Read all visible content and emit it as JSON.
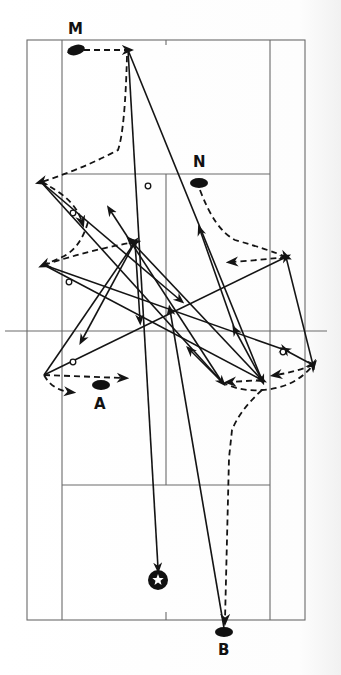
{
  "diagram": {
    "colors": {
      "ink": "#141414",
      "court": "#6a6a6a",
      "background": "#ffffff"
    },
    "court": {
      "outer": {
        "x1": 27,
        "y1": 40,
        "x2": 305,
        "y2": 620
      },
      "singles_sidelines_x": [
        62,
        270
      ],
      "net_y": 331,
      "net_x_range": [
        5,
        327
      ],
      "short_service_lines_y": [
        174,
        485
      ],
      "center_line_x": 166,
      "center_ticks": [
        {
          "y1": 40,
          "y2": 45
        },
        {
          "y1": 612,
          "y2": 620
        }
      ]
    },
    "players": [
      {
        "id": "M",
        "label": "M",
        "x": 76,
        "y": 50,
        "label_x": 68,
        "label_y": 34
      },
      {
        "id": "N",
        "label": "N",
        "x": 199,
        "y": 183,
        "label_x": 193,
        "label_y": 167
      },
      {
        "id": "A",
        "label": "A",
        "x": 101,
        "y": 385,
        "label_x": 94,
        "label_y": 409
      },
      {
        "id": "B",
        "label": "B",
        "x": 224,
        "y": 632,
        "label_x": 218,
        "label_y": 655
      }
    ],
    "shuttle_end": {
      "symbol": "star",
      "x": 158,
      "y": 580
    },
    "shots": [
      {
        "from": [
          128,
          50
        ],
        "to": [
          158,
          568
        ]
      },
      {
        "from": [
          128,
          50
        ],
        "to": [
          262,
          380
        ]
      },
      {
        "from": [
          41,
          182
        ],
        "to": [
          222,
          382
        ]
      },
      {
        "from": [
          41,
          182
        ],
        "to": [
          180,
          300
        ]
      },
      {
        "from": [
          44,
          265
        ],
        "to": [
          262,
          380
        ]
      },
      {
        "from": [
          44,
          265
        ],
        "to": [
          285,
          350
        ]
      },
      {
        "from": [
          135,
          242
        ],
        "to": [
          82,
          340
        ]
      },
      {
        "from": [
          135,
          242
        ],
        "to": [
          140,
          320
        ]
      },
      {
        "from": [
          44,
          375
        ],
        "to": [
          135,
          242
        ]
      },
      {
        "from": [
          44,
          375
        ],
        "to": [
          286,
          257
        ]
      },
      {
        "from": [
          286,
          257
        ],
        "to": [
          313,
          365
        ]
      },
      {
        "from": [
          313,
          365
        ],
        "to": [
          285,
          350
        ]
      },
      {
        "from": [
          222,
          382
        ],
        "to": [
          190,
          350
        ]
      },
      {
        "from": [
          262,
          380
        ],
        "to": [
          235,
          330
        ]
      },
      {
        "from": [
          222,
          382
        ],
        "to": [
          110,
          210
        ]
      },
      {
        "from": [
          262,
          380
        ],
        "to": [
          130,
          240
        ]
      },
      {
        "from": [
          224,
          628
        ],
        "to": [
          170,
          310
        ]
      },
      {
        "from": [
          235,
          330
        ],
        "to": [
          200,
          230
        ]
      }
    ],
    "hollow_markers": [
      {
        "x": 148,
        "y": 186
      },
      {
        "x": 73,
        "y": 213
      },
      {
        "x": 69,
        "y": 282
      },
      {
        "x": 73,
        "y": 362
      },
      {
        "x": 283,
        "y": 352
      }
    ],
    "movements": [
      {
        "path": "M 84 50 L 128 50"
      },
      {
        "path": "M 127 56 Q 125 130 118 150 Q 80 170 41 182"
      },
      {
        "path": "M 41 182 Q 75 198 82 222"
      },
      {
        "path": "M 88 222 Q 80 250 60 258 L 44 265"
      },
      {
        "path": "M 44 265 Q 90 250 135 242"
      },
      {
        "path": "M 200 190 Q 215 230 235 240 Q 270 250 286 257"
      },
      {
        "path": "M 286 257 Q 260 260 232 262"
      },
      {
        "path": "M 44 375 L 123 378"
      },
      {
        "path": "M 44 375 Q 52 390 70 392"
      },
      {
        "path": "M 262 380 L 230 382"
      },
      {
        "path": "M 222 382 Q 240 392 262 390 Q 295 388 313 365"
      },
      {
        "path": "M 313 365 Q 295 372 276 375"
      },
      {
        "path": "M 262 390 Q 240 410 232 430 L 229 458 L 225 620"
      }
    ]
  }
}
